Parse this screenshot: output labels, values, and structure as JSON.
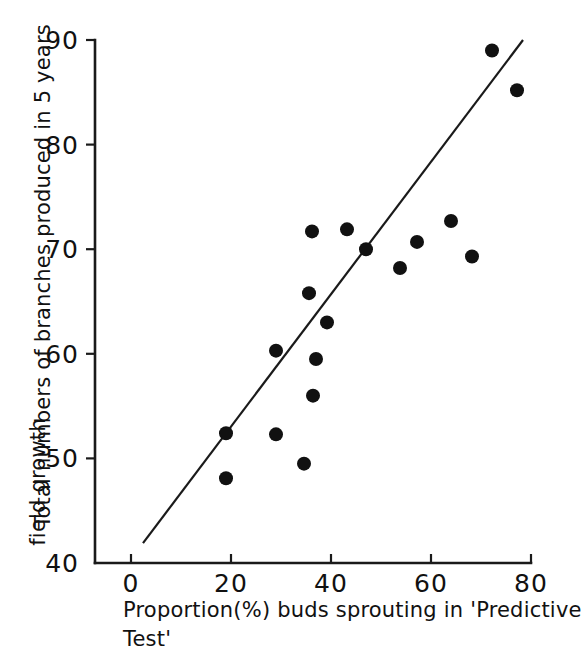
{
  "chart_data": {
    "type": "scatter",
    "title": "",
    "xlabel": "Proportion(%) buds sprouting in 'Predictive Test'",
    "ylabel": "Total numbers of branches produced in 5 years field growth",
    "xlabel_line1": "Proportion(%) buds sprouting in 'Predictive",
    "xlabel_line2": "Test'",
    "ylabel_line1": "Total numbers of branches produced in 5 years",
    "ylabel_line2": "field growth",
    "xlim": [
      -3,
      82
    ],
    "ylim": [
      40,
      90
    ],
    "xticks": [
      0,
      20,
      40,
      60,
      80
    ],
    "yticks": [
      40,
      50,
      60,
      70,
      80,
      90
    ],
    "xtick_labels": [
      "0",
      "20",
      "40",
      "60",
      "80"
    ],
    "ytick_labels": [
      "40",
      "50",
      "60",
      "70",
      "80",
      "90"
    ],
    "grid": false,
    "legend": false,
    "marker_color": "#111111",
    "line_color": "#1a1a1a",
    "axis_color": "#1a1a1a",
    "points": [
      {
        "x": 19.0,
        "y": 52.4
      },
      {
        "x": 19.0,
        "y": 48.1
      },
      {
        "x": 29.0,
        "y": 60.3
      },
      {
        "x": 29.0,
        "y": 52.3
      },
      {
        "x": 34.6,
        "y": 49.5
      },
      {
        "x": 35.6,
        "y": 65.8
      },
      {
        "x": 36.2,
        "y": 71.7
      },
      {
        "x": 36.4,
        "y": 56.0
      },
      {
        "x": 37.0,
        "y": 59.5
      },
      {
        "x": 39.2,
        "y": 63.0
      },
      {
        "x": 43.2,
        "y": 71.9
      },
      {
        "x": 47.0,
        "y": 70.0
      },
      {
        "x": 53.8,
        "y": 68.2
      },
      {
        "x": 57.2,
        "y": 70.7
      },
      {
        "x": 64.0,
        "y": 72.7
      },
      {
        "x": 68.2,
        "y": 69.3
      },
      {
        "x": 72.2,
        "y": 89.0
      },
      {
        "x": 77.2,
        "y": 85.2
      }
    ],
    "fit_line": {
      "x1": 2.4,
      "y1": 41.9,
      "x2": 78.4,
      "y2": 90.0
    },
    "n_points": 18,
    "marker_radius_px": 7
  }
}
